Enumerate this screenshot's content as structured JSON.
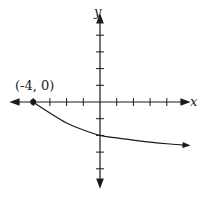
{
  "chart_data": {
    "type": "line",
    "title": "",
    "xlabel": "x",
    "ylabel": "y",
    "xlim": [
      -5.3,
      5.3
    ],
    "ylim": [
      -5,
      5.5
    ],
    "grid": false,
    "x_ticks": [
      -4,
      -3,
      -2,
      -1,
      1,
      2,
      3,
      4
    ],
    "y_ticks": [
      4,
      3,
      2,
      1,
      -1,
      -2,
      -3,
      -4
    ],
    "series": [
      {
        "name": "curve",
        "x": [
          -4,
          -3,
          -2,
          -1,
          0,
          1,
          2,
          3,
          4,
          5.3
        ],
        "y": [
          0,
          -0.66,
          -1.26,
          -1.68,
          -2,
          -2.15,
          -2.28,
          -2.4,
          -2.5,
          -2.6
        ],
        "endpoint_closed": {
          "x": -4,
          "y": 0
        },
        "right_arrow": true
      }
    ],
    "annotations": [
      {
        "text": "(-4, 0)",
        "x": -4,
        "y": 0
      }
    ]
  },
  "labels": {
    "x_axis": "x",
    "y_axis": "y",
    "point": "(-4, 0)"
  },
  "colors": {
    "ink": "#1a1a1a"
  }
}
